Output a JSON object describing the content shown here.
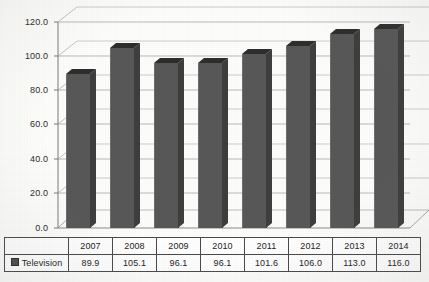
{
  "chart_data": {
    "type": "bar",
    "title": "",
    "subtitle": "",
    "xlabel": "",
    "ylabel": "",
    "categories": [
      "2007",
      "2008",
      "2009",
      "2010",
      "2011",
      "2012",
      "2013",
      "2014"
    ],
    "series": [
      {
        "name": "Television",
        "values": [
          89.9,
          105.1,
          96.1,
          96.1,
          101.6,
          106.0,
          113.0,
          116.0
        ],
        "color": "#585858"
      }
    ],
    "values": [
      89.9,
      105.1,
      96.1,
      96.1,
      101.6,
      106.0,
      113.0,
      116.0
    ],
    "ylim": [
      0.0,
      120.0
    ],
    "ytick_labels": [
      "120.0",
      "100.0",
      "80.0",
      "60.0",
      "40.0",
      "20.0",
      "0.0"
    ],
    "ytick_values": [
      120.0,
      100.0,
      80.0,
      60.0,
      40.0,
      20.0,
      0.0
    ],
    "ytick_step": 20.0,
    "grid": true,
    "legend_position": "table-bottom-left",
    "style": "3d-column",
    "annotations": []
  },
  "table": {
    "header_row": [
      "",
      "2007",
      "2008",
      "2009",
      "2010",
      "2011",
      "2012",
      "2013",
      "2014"
    ],
    "value_row_label": "Television",
    "value_row": [
      "89.9",
      "105.1",
      "96.1",
      "96.1",
      "101.6",
      "106.0",
      "113.0",
      "116.0"
    ]
  },
  "legend": {
    "swatch_name": "legend-swatch",
    "label": "Television",
    "color": "#4d4d4d"
  },
  "colors": {
    "bar_front": "#585858",
    "bar_side": "#3e3e3e",
    "bar_top": "#2e2e2e",
    "grid_line": "#b9b9b9",
    "axis_line": "#7a7a7a",
    "background": "#fdfdfc",
    "text": "#242424"
  }
}
